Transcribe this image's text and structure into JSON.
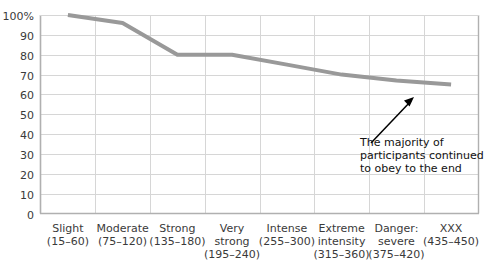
{
  "chart_data": {
    "type": "line",
    "title": "",
    "xlabel": "",
    "ylabel": "",
    "ylim": [
      0,
      100
    ],
    "grid": true,
    "legend": "none",
    "series_color": "#999999",
    "categories": [
      "Slight\n(15–60)",
      "Moderate\n(75–120)",
      "Strong\n(135–180)",
      "Very\nstrong\n(195–240)",
      "Intense\n(255–300)",
      "Extreme\nintensity\n(315–360)",
      "Danger:\nsevere\n(375–420)",
      "XXX\n(435–450)"
    ],
    "values": [
      100,
      96,
      80,
      80,
      75,
      70,
      67,
      65
    ],
    "ytick_labels": [
      "100%",
      "90",
      "80",
      "70",
      "60",
      "50",
      "40",
      "30",
      "20",
      "10",
      "0"
    ],
    "ytick_values": [
      100,
      90,
      80,
      70,
      60,
      50,
      40,
      30,
      20,
      10,
      0
    ],
    "annotations": [
      {
        "text_lines": [
          "The majority of",
          "participants continued",
          "to obey to the end"
        ],
        "arrow": "points up-right to end of line"
      }
    ]
  },
  "xaxis": {
    "categories": [
      {
        "line1": "Slight",
        "line2": "(15–60)",
        "line3": ""
      },
      {
        "line1": "Moderate",
        "line2": "(75–120)",
        "line3": ""
      },
      {
        "line1": "Strong",
        "line2": "(135–180)",
        "line3": ""
      },
      {
        "line1": "Very",
        "line2": "strong",
        "line3": "(195–240)"
      },
      {
        "line1": "Intense",
        "line2": "(255–300)",
        "line3": ""
      },
      {
        "line1": "Extreme",
        "line2": "intensity",
        "line3": "(315–360)"
      },
      {
        "line1": "Danger:",
        "line2": "severe",
        "line3": "(375–420)"
      },
      {
        "line1": "XXX",
        "line2": "(435–450)",
        "line3": ""
      }
    ]
  },
  "yaxis": {
    "ticks": [
      "100%",
      "90",
      "80",
      "70",
      "60",
      "50",
      "40",
      "30",
      "20",
      "10",
      "0"
    ]
  },
  "annotation": {
    "line1": "The majority of",
    "line2": "participants continued",
    "line3": "to obey to the end"
  },
  "colors": {
    "series": "#999999",
    "grid": "#d6d6d6",
    "axis": "#b0b0b0",
    "text": "#3a3a3a",
    "annotation_text": "#111111",
    "arrow": "#000000",
    "background": "#ffffff"
  }
}
